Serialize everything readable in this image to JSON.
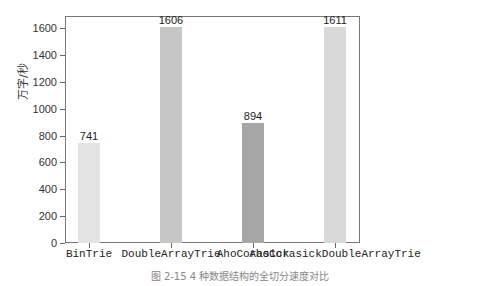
{
  "chart_data": {
    "type": "bar",
    "title": "",
    "caption": "图 2-15   4 种数据结构的全切分速度对比",
    "xlabel": "",
    "ylabel": "万字/秒",
    "categories": [
      "BinTrie",
      "DoubleArrayTrie",
      "AhoCorasick",
      "AhoCorasickDoubleArrayTrie"
    ],
    "values": [
      741,
      1606,
      894,
      1611
    ],
    "value_labels": [
      "741",
      "1606",
      "894",
      "1611"
    ],
    "colors": [
      "#e4e4e4",
      "#c6c6c6",
      "#a6a6a6",
      "#d9d9d9"
    ],
    "yticks": [
      "0",
      "200",
      "400",
      "600",
      "800",
      "1000",
      "1200",
      "1400",
      "1600"
    ],
    "ylim": [
      0,
      1690
    ],
    "grid": false,
    "legend": null
  }
}
